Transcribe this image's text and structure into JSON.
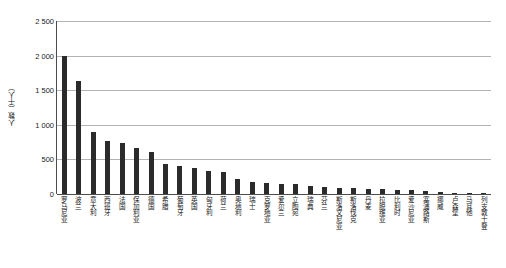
{
  "chart_data": {
    "type": "bar",
    "title": "",
    "xlabel": "",
    "ylabel": "人数（千人）",
    "ylim": [
      0,
      2500
    ],
    "yticks": [
      "0",
      "500",
      "1 000",
      "1 500",
      "2 000",
      "2 500"
    ],
    "ytick_values": [
      0,
      500,
      1000,
      1500,
      2000,
      2500
    ],
    "grid": true,
    "legend": false,
    "categories": [
      "罗马尼亚",
      "波兰",
      "意大利",
      "西班牙",
      "法国",
      "保加利亚",
      "德国",
      "希腊",
      "葡萄牙",
      "英国",
      "匈牙利",
      "荷兰",
      "奥地利",
      "瑞士",
      "克罗地亚",
      "爱尔兰",
      "立陶宛",
      "瑞典",
      "芬兰",
      "斯洛文尼亚",
      "斯洛伐克",
      "丹麦",
      "拉脱维亚",
      "比利时",
      "爱沙尼亚",
      "塞浦路斯",
      "挪威",
      "卢森堡",
      "马耳他",
      "列支敦士登"
    ],
    "values": [
      2000,
      1630,
      900,
      760,
      740,
      660,
      600,
      430,
      400,
      380,
      330,
      320,
      210,
      180,
      155,
      150,
      150,
      110,
      95,
      90,
      80,
      75,
      70,
      65,
      60,
      40,
      25,
      15,
      10,
      5
    ]
  }
}
